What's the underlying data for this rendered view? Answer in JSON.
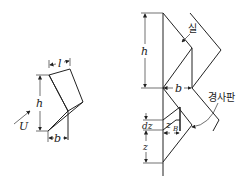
{
  "left_figure": {
    "labels": {
      "length": "l",
      "height": "h",
      "width": "b",
      "flow": "U"
    }
  },
  "right_figure": {
    "labels": {
      "thread": "실",
      "height": "h",
      "width": "b",
      "inclined_plate": "경사판",
      "element_height": "dz",
      "position": "z",
      "local_width": "z",
      "local_width_sub": "B"
    }
  }
}
